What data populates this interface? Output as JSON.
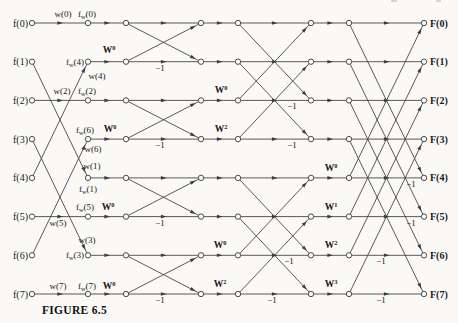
{
  "figure": {
    "caption": "FIGURE 6.5"
  },
  "diagram": {
    "width": 458,
    "height": 323,
    "bg": "#faf9f6",
    "line_color": "#3c3c3c",
    "text_color": "#1a1a1a",
    "node_radius": 2.7,
    "rows_y": [
      23,
      61.7,
      100.4,
      139.1,
      177.9,
      216.6,
      255.3,
      294
    ],
    "cols_x": [
      32,
      88,
      126,
      201,
      238,
      311,
      349,
      424
    ],
    "input_label_x": 28,
    "output_label_x": 430,
    "inputs": [
      "f(0)",
      "f(1)",
      "f(2)",
      "f(3)",
      "f(4)",
      "f(5)",
      "f(6)",
      "f(7)"
    ],
    "outputs": [
      "F(0)",
      "F(1)",
      "F(2)",
      "F(3)",
      "F(4)",
      "F(5)",
      "F(6)",
      "F(7)"
    ],
    "stages": [
      {
        "type": "perm",
        "from_col": 0,
        "to_col": 1,
        "map": [
          0,
          4,
          2,
          6,
          1,
          5,
          3,
          7
        ]
      },
      {
        "type": "straight",
        "from_col": 1,
        "to_col": 2
      },
      {
        "type": "butterfly",
        "from_col": 2,
        "to_col": 3,
        "pairs": [
          [
            0,
            1
          ],
          [
            2,
            3
          ],
          [
            4,
            5
          ],
          [
            6,
            7
          ]
        ]
      },
      {
        "type": "straight",
        "from_col": 3,
        "to_col": 4
      },
      {
        "type": "butterfly",
        "from_col": 4,
        "to_col": 5,
        "pairs": [
          [
            0,
            2
          ],
          [
            1,
            3
          ],
          [
            4,
            6
          ],
          [
            5,
            7
          ]
        ]
      },
      {
        "type": "straight",
        "from_col": 5,
        "to_col": 6
      },
      {
        "type": "butterfly",
        "from_col": 6,
        "to_col": 7,
        "pairs": [
          [
            0,
            4
          ],
          [
            1,
            5
          ],
          [
            2,
            6
          ],
          [
            3,
            7
          ]
        ]
      }
    ],
    "annotations": [
      {
        "name": "w0",
        "x": 63,
        "y": 17,
        "anchor": "middle",
        "parts": [
          "w(0)"
        ]
      },
      {
        "name": "fw0",
        "x": 87,
        "y": 17,
        "anchor": "middle",
        "parts": [
          "f",
          {
            "sub": "w"
          },
          "(0)"
        ]
      },
      {
        "name": "w2",
        "x": 62,
        "y": 94,
        "anchor": "middle",
        "parts": [
          "w(2)"
        ]
      },
      {
        "name": "fw2",
        "x": 87,
        "y": 94,
        "anchor": "middle",
        "parts": [
          "f",
          {
            "sub": "w"
          },
          "(2)"
        ]
      },
      {
        "name": "tw-s1-r1",
        "x": 109,
        "y": 53,
        "anchor": "middle",
        "bold": true,
        "parts": [
          "W",
          {
            "sup": "0"
          }
        ]
      },
      {
        "name": "fw4",
        "x": 84,
        "y": 65,
        "anchor": "end",
        "parts": [
          "f",
          {
            "sub": "w"
          },
          "(4)"
        ]
      },
      {
        "name": "w4",
        "x": 97,
        "y": 79,
        "anchor": "middle",
        "parts": [
          "w(4)"
        ]
      },
      {
        "name": "fw6",
        "x": 85,
        "y": 133,
        "anchor": "middle",
        "parts": [
          "f",
          {
            "sub": "w"
          },
          "(6)"
        ]
      },
      {
        "name": "tw-s1-r3",
        "x": 110,
        "y": 132,
        "anchor": "middle",
        "bold": true,
        "parts": [
          "W",
          {
            "sup": "0"
          }
        ]
      },
      {
        "name": "w6",
        "x": 93,
        "y": 152,
        "anchor": "middle",
        "parts": [
          "w(6)"
        ]
      },
      {
        "name": "w1",
        "x": 92,
        "y": 169,
        "anchor": "middle",
        "parts": [
          "w(1)"
        ]
      },
      {
        "name": "fw1",
        "x": 88,
        "y": 192,
        "anchor": "middle",
        "parts": [
          "f",
          {
            "sub": "w"
          },
          "(1)"
        ]
      },
      {
        "name": "w5",
        "x": 58,
        "y": 226,
        "anchor": "middle",
        "parts": [
          "w(5)"
        ]
      },
      {
        "name": "fw5",
        "x": 85,
        "y": 210,
        "anchor": "middle",
        "parts": [
          "f",
          {
            "sub": "w"
          },
          "(5)"
        ]
      },
      {
        "name": "tw-s1-r5",
        "x": 108,
        "y": 210,
        "anchor": "middle",
        "bold": true,
        "parts": [
          "W",
          {
            "sup": "0"
          }
        ]
      },
      {
        "name": "w3",
        "x": 87,
        "y": 243,
        "anchor": "middle",
        "parts": [
          "w(3)"
        ]
      },
      {
        "name": "fw3",
        "x": 84,
        "y": 258,
        "anchor": "end",
        "parts": [
          "f",
          {
            "sub": "w"
          },
          "(3)"
        ]
      },
      {
        "name": "w7",
        "x": 58,
        "y": 289,
        "anchor": "middle",
        "parts": [
          "w(7)"
        ]
      },
      {
        "name": "fw7",
        "x": 87,
        "y": 289,
        "anchor": "middle",
        "parts": [
          "f",
          {
            "sub": "w"
          },
          "(7)"
        ]
      },
      {
        "name": "tw-s1-r7",
        "x": 109,
        "y": 289,
        "anchor": "middle",
        "bold": true,
        "parts": [
          "W",
          {
            "sup": "0"
          }
        ]
      },
      {
        "name": "tw-s2-r2",
        "x": 221,
        "y": 93,
        "anchor": "middle",
        "bold": true,
        "parts": [
          "W",
          {
            "sup": "0"
          }
        ]
      },
      {
        "name": "tw-s2-r3",
        "x": 221,
        "y": 132,
        "anchor": "middle",
        "bold": true,
        "parts": [
          "W",
          {
            "sup": "2"
          }
        ]
      },
      {
        "name": "tw-s2-r6",
        "x": 220,
        "y": 248,
        "anchor": "middle",
        "bold": true,
        "parts": [
          "W",
          {
            "sup": "0"
          }
        ]
      },
      {
        "name": "tw-s2-r7",
        "x": 220,
        "y": 287,
        "anchor": "middle",
        "bold": true,
        "parts": [
          "W",
          {
            "sup": "2"
          }
        ]
      },
      {
        "name": "tw-s3-r4",
        "x": 331,
        "y": 171,
        "anchor": "middle",
        "bold": true,
        "parts": [
          "W",
          {
            "sup": "0"
          }
        ]
      },
      {
        "name": "tw-s3-r5",
        "x": 331,
        "y": 210,
        "anchor": "middle",
        "bold": true,
        "parts": [
          "W",
          {
            "sup": "1"
          }
        ]
      },
      {
        "name": "tw-s3-r6",
        "x": 331,
        "y": 248,
        "anchor": "middle",
        "bold": true,
        "parts": [
          "W",
          {
            "sup": "2"
          }
        ]
      },
      {
        "name": "tw-s3-r7",
        "x": 331,
        "y": 287,
        "anchor": "middle",
        "bold": true,
        "parts": [
          "W",
          {
            "sup": "3"
          }
        ]
      },
      {
        "name": "m1-s1-r1",
        "x": 160,
        "y": 71,
        "anchor": "middle",
        "parts": [
          "−1"
        ]
      },
      {
        "name": "m1-s1-r3",
        "x": 160,
        "y": 148,
        "anchor": "middle",
        "parts": [
          "−1"
        ]
      },
      {
        "name": "m1-s1-r5",
        "x": 160,
        "y": 226,
        "anchor": "middle",
        "parts": [
          "−1"
        ]
      },
      {
        "name": "m1-s1-r7",
        "x": 160,
        "y": 303,
        "anchor": "middle",
        "parts": [
          "−1"
        ]
      },
      {
        "name": "m1-s2-r2",
        "x": 292,
        "y": 109,
        "anchor": "middle",
        "parts": [
          "−1"
        ]
      },
      {
        "name": "m1-s2-r3",
        "x": 292,
        "y": 148,
        "anchor": "middle",
        "parts": [
          "−1"
        ]
      },
      {
        "name": "m1-s2-r6",
        "x": 289,
        "y": 264,
        "anchor": "middle",
        "parts": [
          "−1"
        ]
      },
      {
        "name": "m1-s2-r7",
        "x": 272,
        "y": 303,
        "anchor": "middle",
        "parts": [
          "−1"
        ]
      },
      {
        "name": "m1-s3-r4",
        "x": 411,
        "y": 187,
        "anchor": "middle",
        "parts": [
          "−1"
        ]
      },
      {
        "name": "m1-s3-r5",
        "x": 411,
        "y": 226,
        "anchor": "middle",
        "parts": [
          "−1"
        ]
      },
      {
        "name": "m1-s3-r6",
        "x": 381,
        "y": 264,
        "anchor": "middle",
        "parts": [
          "−1"
        ]
      },
      {
        "name": "m1-s3-r7",
        "x": 381,
        "y": 303,
        "anchor": "middle",
        "parts": [
          "−1"
        ]
      }
    ]
  }
}
